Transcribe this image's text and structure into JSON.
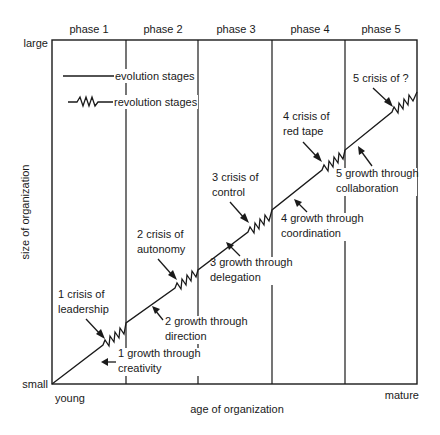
{
  "diagram": {
    "type": "greiner-growth-model",
    "x_axis": {
      "label": "age of organization",
      "start_label": "young",
      "end_label": "mature"
    },
    "y_axis": {
      "label": "size of organization",
      "start_label": "small",
      "end_label": "large"
    },
    "phases": [
      {
        "label": "phase 1"
      },
      {
        "label": "phase 2"
      },
      {
        "label": "phase 3"
      },
      {
        "label": "phase 4"
      },
      {
        "label": "phase 5"
      }
    ],
    "legend": {
      "evolution": "evolution stages",
      "revolution": "revolution stages"
    },
    "crises": [
      {
        "line1": "1 crisis of",
        "line2": "leadership"
      },
      {
        "line1": "2 crisis of",
        "line2": "autonomy"
      },
      {
        "line1": "3 crisis of",
        "line2": "control"
      },
      {
        "line1": "4 crisis of",
        "line2": "red tape"
      },
      {
        "line1": "5 crisis of ?",
        "line2": ""
      }
    ],
    "growths": [
      {
        "line1": "1 growth through",
        "line2": "creativity"
      },
      {
        "line1": "2 growth through",
        "line2": "direction"
      },
      {
        "line1": "3 growth through",
        "line2": "delegation"
      },
      {
        "line1": "4 growth through",
        "line2": "coordination"
      },
      {
        "line1": "5 growth through",
        "line2": "collaboration"
      }
    ],
    "colors": {
      "ink": "#1a1a1a",
      "background": "#ffffff"
    }
  }
}
